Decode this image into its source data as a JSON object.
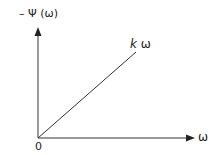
{
  "diagram": {
    "y_axis_label": "– Ψ (ω)",
    "x_axis_label": "ω",
    "origin_label": "0",
    "line_label_k": "k",
    "line_label_var": "ω",
    "line_description": "straight line through origin with slope k"
  },
  "colors": {
    "line": "#333333",
    "background": "#ffffff"
  }
}
